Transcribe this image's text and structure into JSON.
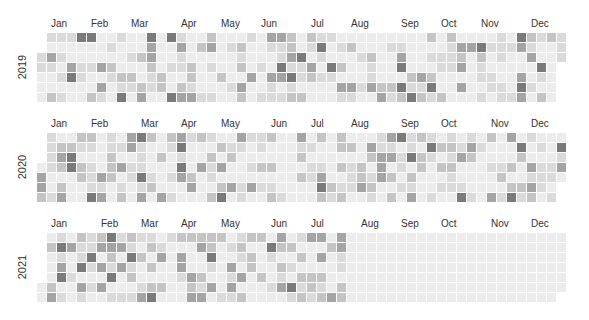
{
  "chart_data": {
    "type": "heatmap",
    "title": "",
    "years": [
      "2019",
      "2020",
      "2021"
    ],
    "months": [
      "Jan",
      "Feb",
      "Mar",
      "Apr",
      "May",
      "Jun",
      "Jul",
      "Aug",
      "Sep",
      "Oct",
      "Nov",
      "Dec"
    ],
    "level_colors": [
      "#ececec",
      "#dadada",
      "#c4c4c4",
      "#a4a4a4",
      "#7a7a7a"
    ],
    "data_end": "2021-07-31",
    "grid": {
      "cell": 9,
      "pitch": 10,
      "left": 37
    },
    "blocks": [
      {
        "year": "2019",
        "top": 33,
        "label_y": 18,
        "seed": 7
      },
      {
        "year": "2020",
        "top": 133,
        "label_y": 118,
        "seed": 23
      },
      {
        "year": "2021",
        "top": 233,
        "label_y": 218,
        "seed": 51
      }
    ]
  }
}
